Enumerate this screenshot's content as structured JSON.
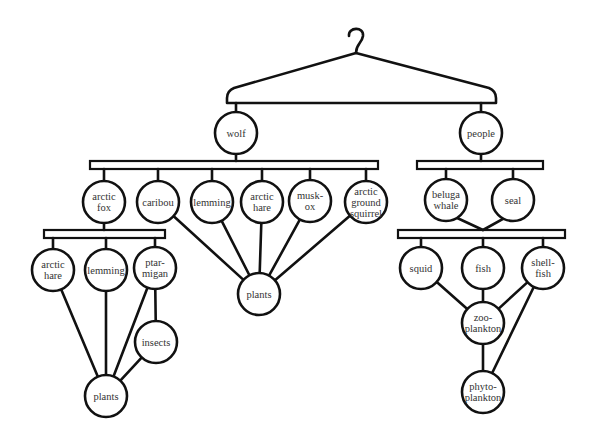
{
  "colors": {
    "line": "#111111",
    "text": "#333333",
    "background": "#ffffff"
  },
  "nodes": {
    "wolf": {
      "label": [
        "wolf"
      ],
      "x": 236,
      "y": 133
    },
    "people": {
      "label": [
        "people"
      ],
      "x": 481,
      "y": 133
    },
    "arctic_fox": {
      "label": [
        "arctic",
        "fox"
      ],
      "x": 104,
      "y": 202
    },
    "caribou": {
      "label": [
        "caribou"
      ],
      "x": 158,
      "y": 202
    },
    "lemming_top": {
      "label": [
        "lemming"
      ],
      "x": 212,
      "y": 202
    },
    "arctic_hare_top": {
      "label": [
        "arctic",
        "hare"
      ],
      "x": 262,
      "y": 202
    },
    "musk_ox": {
      "label": [
        "musk-",
        "ox"
      ],
      "x": 310,
      "y": 201
    },
    "arctic_ground_squirrel": {
      "label": [
        "arctic",
        "ground",
        "squirrel"
      ],
      "x": 366,
      "y": 202
    },
    "beluga_whale": {
      "label": [
        "beluga",
        "whale"
      ],
      "x": 446,
      "y": 200
    },
    "seal": {
      "label": [
        "seal"
      ],
      "x": 513,
      "y": 200
    },
    "arctic_hare_left": {
      "label": [
        "arctic",
        "hare"
      ],
      "x": 53,
      "y": 270
    },
    "lemming_left": {
      "label": [
        "lemming"
      ],
      "x": 106,
      "y": 270
    },
    "ptarmigan": {
      "label": [
        "ptar-",
        "migan"
      ],
      "x": 155,
      "y": 268
    },
    "insects": {
      "label": [
        "insects"
      ],
      "x": 156,
      "y": 342
    },
    "plants_left": {
      "label": [
        "plants"
      ],
      "x": 106,
      "y": 396
    },
    "plants_center": {
      "label": [
        "plants"
      ],
      "x": 259,
      "y": 294
    },
    "squid": {
      "label": [
        "squid"
      ],
      "x": 421,
      "y": 268
    },
    "fish": {
      "label": [
        "fish"
      ],
      "x": 483,
      "y": 268
    },
    "shellfish": {
      "label": [
        "shell-",
        "fish"
      ],
      "x": 543,
      "y": 268
    },
    "zooplankton": {
      "label": [
        "zoo-",
        "plankton"
      ],
      "x": 483,
      "y": 323
    },
    "phytoplankton": {
      "label": [
        "phyto-",
        "plankton"
      ],
      "x": 483,
      "y": 392
    }
  },
  "bars": [
    {
      "id": "wolf-bar",
      "x1": 90,
      "x2": 378,
      "y": 165
    },
    {
      "id": "people-bar",
      "x1": 417,
      "x2": 543,
      "y": 165
    },
    {
      "id": "fox-bar",
      "x1": 44,
      "x2": 165,
      "y": 234
    },
    {
      "id": "marine-bar",
      "x1": 398,
      "x2": 565,
      "y": 234
    }
  ],
  "edges": [
    [
      "caribou",
      "plants_center"
    ],
    [
      "lemming_top",
      "plants_center"
    ],
    [
      "arctic_hare_top",
      "plants_center"
    ],
    [
      "musk_ox",
      "plants_center"
    ],
    [
      "arctic_ground_squirrel",
      "plants_center"
    ],
    [
      "arctic_hare_left",
      "plants_left"
    ],
    [
      "lemming_left",
      "plants_left"
    ],
    [
      "ptarmigan",
      "plants_left"
    ],
    [
      "ptarmigan",
      "insects"
    ],
    [
      "insects",
      "plants_left"
    ],
    [
      "squid",
      "zooplankton"
    ],
    [
      "fish",
      "zooplankton"
    ],
    [
      "shellfish",
      "zooplankton"
    ],
    [
      "shellfish",
      "phytoplankton"
    ],
    [
      "zooplankton",
      "phytoplankton"
    ]
  ]
}
